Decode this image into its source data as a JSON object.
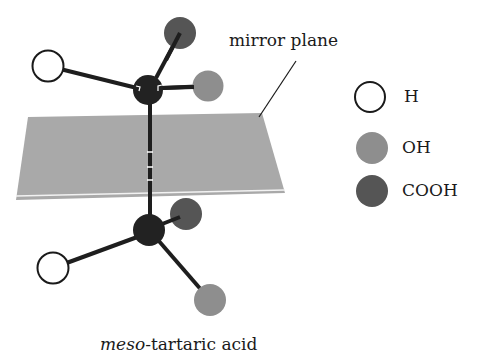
{
  "title": "meso-tartaric acid",
  "caption": {
    "prefix_italic": "meso",
    "suffix": "-tartaric acid"
  },
  "annotation": {
    "mirror_plane_label": "mirror plane"
  },
  "legend": [
    {
      "label": "H",
      "fill": "#ffffff",
      "stroke": "#1a1a1a"
    },
    {
      "label": "OH",
      "fill": "#8e8e8e",
      "stroke": "#8e8e8e"
    },
    {
      "label": "COOH",
      "fill": "#555555",
      "stroke": "#555555"
    }
  ],
  "colors": {
    "carbon": "#222222",
    "bond": "#1e1e1e",
    "plane": "#a9a9a9",
    "plane_edge_highlight": "#f2f2f2",
    "H": "#ffffff",
    "OH": "#8e8e8e",
    "COOH": "#555555"
  },
  "molecule": {
    "top_carbon": {
      "group_positions": [
        "H (left)",
        "COOH (up-right)",
        "OH (right)"
      ]
    },
    "bottom_carbon": {
      "group_positions": [
        "H (lower-left)",
        "COOH (up-right, behind)",
        "OH (lower-right)"
      ]
    }
  }
}
